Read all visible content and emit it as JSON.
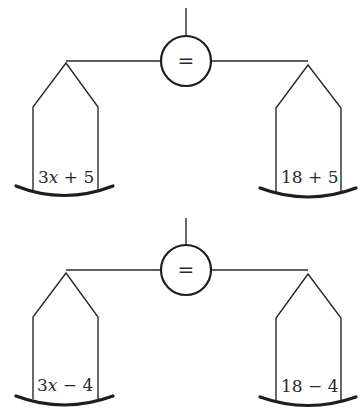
{
  "scales": [
    {
      "name": "balance-scale-1",
      "center_symbol": "=",
      "left_pan": {
        "var_part": "3",
        "var": "x",
        "rest": " + 5",
        "full": "3x + 5"
      },
      "right_pan": {
        "full": "18 + 5"
      }
    },
    {
      "name": "balance-scale-2",
      "center_symbol": "=",
      "left_pan": {
        "var_part": "3",
        "var": "x",
        "rest": " − 4",
        "full": "3x − 4"
      },
      "right_pan": {
        "full": "18 − 4"
      }
    }
  ],
  "colors": {
    "stroke": "#2a2a2a",
    "background": "#ffffff"
  }
}
